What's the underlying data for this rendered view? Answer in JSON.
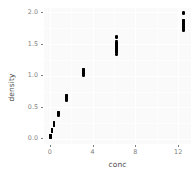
{
  "chart_data": {
    "type": "scatter",
    "title": "",
    "xlabel": "conc",
    "ylabel": "density",
    "xlim": [
      -0.55,
      13.2
    ],
    "ylim": [
      -0.08,
      2.07
    ],
    "grid": true,
    "legend": false,
    "x_ticks": [
      0,
      4,
      8,
      12
    ],
    "x_tick_labels": [
      "0",
      "4",
      "8",
      "12"
    ],
    "y_ticks": [
      0.0,
      0.5,
      1.0,
      1.5,
      2.0
    ],
    "y_tick_labels": [
      "0.0",
      "0.5",
      "1.0",
      "1.5",
      "2.0"
    ],
    "x_minor_ticks": [
      2,
      6,
      10
    ],
    "y_minor_ticks": [
      0.25,
      0.75,
      1.25,
      1.75
    ],
    "point_color": "#000000",
    "panel_color": "#fafafa",
    "grid_color": "#ffffff",
    "axis_text_color": "#7f7f7f",
    "axis_title_color": "#4d4d4d",
    "series": [
      {
        "name": "DNase",
        "x": [
          0.04882812,
          0.04882812,
          0.04882812,
          0.04882812,
          0.04882812,
          0.04882812,
          0.04882812,
          0.04882812,
          0.04882812,
          0.04882812,
          0.04882812,
          0.04882812,
          0.04882812,
          0.04882812,
          0.04882812,
          0.04882812,
          0.04882812,
          0.04882812,
          0.04882812,
          0.04882812,
          0.04882812,
          0.04882812,
          0.1953125,
          0.1953125,
          0.1953125,
          0.1953125,
          0.1953125,
          0.1953125,
          0.1953125,
          0.1953125,
          0.1953125,
          0.1953125,
          0.1953125,
          0.1953125,
          0.1953125,
          0.1953125,
          0.1953125,
          0.1953125,
          0.1953125,
          0.1953125,
          0.1953125,
          0.1953125,
          0.1953125,
          0.1953125,
          0.390625,
          0.390625,
          0.390625,
          0.390625,
          0.390625,
          0.390625,
          0.390625,
          0.390625,
          0.390625,
          0.390625,
          0.390625,
          0.390625,
          0.390625,
          0.390625,
          0.390625,
          0.390625,
          0.390625,
          0.390625,
          0.390625,
          0.390625,
          0.390625,
          0.390625,
          0.78125,
          0.78125,
          0.78125,
          0.78125,
          0.78125,
          0.78125,
          0.78125,
          0.78125,
          0.78125,
          0.78125,
          0.78125,
          0.78125,
          0.78125,
          0.78125,
          0.78125,
          0.78125,
          0.78125,
          0.78125,
          0.78125,
          0.78125,
          0.78125,
          0.78125,
          1.5625,
          1.5625,
          1.5625,
          1.5625,
          1.5625,
          1.5625,
          1.5625,
          1.5625,
          1.5625,
          1.5625,
          1.5625,
          1.5625,
          1.5625,
          1.5625,
          1.5625,
          1.5625,
          1.5625,
          1.5625,
          1.5625,
          1.5625,
          1.5625,
          1.5625,
          3.125,
          3.125,
          3.125,
          3.125,
          3.125,
          3.125,
          3.125,
          3.125,
          3.125,
          3.125,
          3.125,
          3.125,
          3.125,
          3.125,
          3.125,
          3.125,
          3.125,
          3.125,
          3.125,
          3.125,
          3.125,
          3.125,
          6.25,
          6.25,
          6.25,
          6.25,
          6.25,
          6.25,
          6.25,
          6.25,
          6.25,
          6.25,
          6.25,
          6.25,
          6.25,
          6.25,
          6.25,
          6.25,
          6.25,
          6.25,
          6.25,
          6.25,
          6.25,
          6.25,
          12.5,
          12.5,
          12.5,
          12.5,
          12.5,
          12.5,
          12.5,
          12.5,
          12.5,
          12.5,
          12.5,
          12.5,
          12.5,
          12.5,
          12.5,
          12.5,
          12.5,
          12.5,
          12.5,
          12.5,
          12.5,
          12.5
        ],
        "y": [
          0.017,
          0.018,
          0.045,
          0.05,
          0.045,
          0.043,
          0.028,
          0.063,
          0.062,
          0.058,
          0.053,
          0.048,
          0.06,
          0.042,
          0.04,
          0.055,
          0.052,
          0.038,
          0.03,
          0.035,
          0.046,
          0.05,
          0.121,
          0.124,
          0.142,
          0.144,
          0.16,
          0.159,
          0.13,
          0.12,
          0.137,
          0.135,
          0.126,
          0.129,
          0.122,
          0.133,
          0.146,
          0.15,
          0.14,
          0.138,
          0.127,
          0.132,
          0.155,
          0.149,
          0.206,
          0.215,
          0.234,
          0.228,
          0.26,
          0.255,
          0.22,
          0.213,
          0.24,
          0.243,
          0.225,
          0.232,
          0.209,
          0.238,
          0.251,
          0.247,
          0.229,
          0.221,
          0.217,
          0.236,
          0.258,
          0.244,
          0.377,
          0.374,
          0.384,
          0.38,
          0.41,
          0.418,
          0.39,
          0.386,
          0.4,
          0.405,
          0.392,
          0.397,
          0.379,
          0.395,
          0.412,
          0.408,
          0.388,
          0.383,
          0.391,
          0.402,
          0.415,
          0.399,
          0.614,
          0.609,
          0.63,
          0.64,
          0.68,
          0.69,
          0.645,
          0.65,
          0.66,
          0.67,
          0.636,
          0.655,
          0.62,
          0.648,
          0.675,
          0.685,
          0.628,
          0.642,
          0.658,
          0.665,
          0.672,
          0.638,
          1.019,
          1.001,
          1.03,
          1.045,
          1.09,
          1.1,
          1.05,
          1.06,
          1.07,
          1.08,
          1.035,
          1.055,
          1.01,
          1.04,
          1.085,
          1.095,
          1.025,
          1.048,
          1.065,
          1.075,
          1.088,
          1.042,
          1.334,
          1.364,
          1.4,
          1.42,
          1.49,
          1.52,
          1.45,
          1.46,
          1.47,
          1.5,
          1.41,
          1.44,
          1.38,
          1.43,
          1.51,
          1.55,
          1.39,
          1.425,
          1.465,
          1.485,
          1.605,
          1.615,
          1.73,
          1.71,
          1.75,
          1.77,
          1.82,
          1.85,
          1.79,
          1.8,
          1.81,
          1.84,
          1.76,
          1.78,
          1.74,
          1.785,
          1.86,
          1.88,
          1.72,
          1.765,
          1.83,
          1.87,
          1.98,
          1.995
        ]
      }
    ]
  }
}
